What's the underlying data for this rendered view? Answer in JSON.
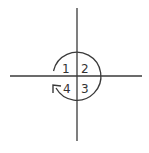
{
  "diagram": {
    "title": "",
    "colors": {
      "stroke": "#3a3a3a",
      "text": "#333333",
      "background": "#ffffff"
    },
    "axes": {
      "vertical": {
        "x": 77,
        "y1": 8,
        "y2": 141
      },
      "horizontal": {
        "y": 76,
        "x1": 10,
        "x2": 142
      }
    },
    "circle_arrow": {
      "center": [
        77,
        76
      ],
      "radius": 24,
      "direction": "clockwise",
      "start_quadrant": 1,
      "end_quadrant": 4
    },
    "quadrants": [
      {
        "label": "1",
        "position": "top-left"
      },
      {
        "label": "2",
        "position": "top-right"
      },
      {
        "label": "3",
        "position": "bottom-right"
      },
      {
        "label": "4",
        "position": "bottom-left"
      }
    ]
  }
}
